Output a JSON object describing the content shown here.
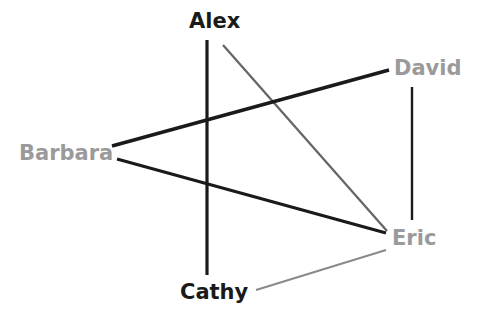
{
  "diagram": {
    "type": "node-link-graph",
    "title": "",
    "width": 482,
    "height": 326,
    "background_color": "#ffffff",
    "node_colors": {
      "dark": "#1a1a1a",
      "gray": "#9a9a9a"
    },
    "edge_colors": {
      "strong": "#1a1a1a",
      "medium": "#4a4a4a",
      "weak": "#8a8a8a"
    }
  },
  "nodes": [
    {
      "id": "alex",
      "label": "Alex",
      "color": "#1a1a1a",
      "shade": "dark",
      "x": 214,
      "y": 22,
      "label_left": 189,
      "label_top": 11
    },
    {
      "id": "barbara",
      "label": "Barbara",
      "color": "#9a9a9a",
      "shade": "gray",
      "x": 62,
      "y": 154,
      "label_left": 19,
      "label_top": 143
    },
    {
      "id": "cathy",
      "label": "Cathy",
      "color": "#1a1a1a",
      "shade": "dark",
      "x": 215,
      "y": 293,
      "label_left": 180,
      "label_top": 282
    },
    {
      "id": "david",
      "label": "David",
      "color": "#9a9a9a",
      "shade": "gray",
      "x": 429,
      "y": 69,
      "label_left": 394,
      "label_top": 58
    },
    {
      "id": "eric",
      "label": "Eric",
      "color": "#9a9a9a",
      "shade": "gray",
      "x": 411,
      "y": 239,
      "label_left": 392,
      "label_top": 228
    }
  ],
  "edges": [
    {
      "id": "alex-cathy",
      "source": "alex",
      "target": "cathy",
      "color": "#1a1a1a",
      "weight_class": "strong",
      "stroke_width": 3.2,
      "x1": 207,
      "y1": 40,
      "x2": 207,
      "y2": 275
    },
    {
      "id": "alex-eric",
      "source": "alex",
      "target": "eric",
      "color": "#666666",
      "weight_class": "medium",
      "stroke_width": 2.3,
      "x1": 223,
      "y1": 45,
      "x2": 387,
      "y2": 231
    },
    {
      "id": "barbara-david",
      "source": "barbara",
      "target": "david",
      "color": "#1a1a1a",
      "weight_class": "strong",
      "stroke_width": 3.4,
      "x1": 112,
      "y1": 146,
      "x2": 389,
      "y2": 70
    },
    {
      "id": "barbara-eric",
      "source": "barbara",
      "target": "eric",
      "color": "#1a1a1a",
      "weight_class": "strong",
      "stroke_width": 3.2,
      "x1": 117,
      "y1": 159,
      "x2": 386,
      "y2": 233
    },
    {
      "id": "cathy-eric",
      "source": "cathy",
      "target": "eric",
      "color": "#8a8a8a",
      "weight_class": "weak",
      "stroke_width": 2.1,
      "x1": 256,
      "y1": 290,
      "x2": 386,
      "y2": 250
    },
    {
      "id": "david-eric",
      "source": "david",
      "target": "eric",
      "color": "#1a1a1a",
      "weight_class": "medium",
      "stroke_width": 2.4,
      "x1": 412,
      "y1": 87,
      "x2": 412,
      "y2": 220
    }
  ]
}
